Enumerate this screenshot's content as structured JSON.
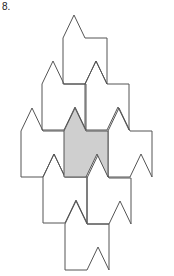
{
  "problem": {
    "label": "8."
  },
  "figure": {
    "tile_size": {
      "width": 44,
      "height": 46,
      "peak_offset_x": 11,
      "peak_height": 23,
      "notch_start_x": 22
    },
    "colors": {
      "stroke": "#555555",
      "shaded_fill": "#cfcfcf",
      "background": "#ffffff"
    },
    "tiles": [
      {
        "x": 63,
        "y": 38,
        "shaded": false
      },
      {
        "x": 42,
        "y": 84,
        "shaded": false
      },
      {
        "x": 85,
        "y": 84,
        "shaded": false
      },
      {
        "x": 21,
        "y": 131,
        "shaded": false
      },
      {
        "x": 64,
        "y": 131,
        "shaded": true
      },
      {
        "x": 108,
        "y": 131,
        "shaded": false
      },
      {
        "x": 43,
        "y": 177,
        "shaded": false
      },
      {
        "x": 87,
        "y": 178,
        "shaded": false
      },
      {
        "x": 65,
        "y": 224,
        "shaded": false
      }
    ]
  }
}
